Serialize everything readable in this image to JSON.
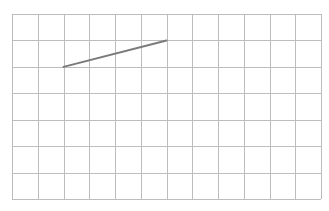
{
  "grid": {
    "x0": 12,
    "y0": 14,
    "x1": 321,
    "y1": 199,
    "cols": 12,
    "rows": 7,
    "line_color": "#bdbdbd",
    "line_width": 1
  },
  "segments": [
    {
      "from": {
        "col": 2,
        "row": 2
      },
      "to": {
        "col": 6,
        "row": 1
      },
      "color": "#7a7a7a",
      "width": 2
    }
  ]
}
